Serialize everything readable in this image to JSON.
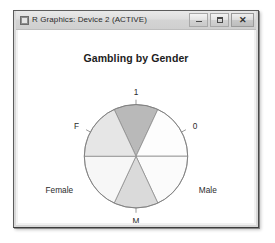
{
  "window": {
    "title": "R Graphics: Device 2 (ACTIVE)",
    "icon": "r-graphics-icon",
    "controls": {
      "minimize_label": "–",
      "maximize_label": "□",
      "close_label": "✕"
    }
  },
  "chart_data": {
    "type": "pie",
    "title": "Gambling by Gender",
    "xlabel": "",
    "ylabel": "",
    "legend_position": "none",
    "grid": false,
    "note": "Radial four-fold / pie style display of a 2x2 table: gender (Female, Male) crossed with gambling response (0, 1). Sector shading encodes cell magnitude; labels sit around the circle perimeter.",
    "categories": [
      "1",
      "0",
      "Male",
      "M",
      "Female",
      "F"
    ],
    "values": [
      55,
      90,
      90,
      55,
      90,
      90
    ],
    "slices": [
      {
        "label": "1",
        "label_position": "top",
        "start_angle": 65,
        "end_angle": 115,
        "value": 55,
        "color": "#b9b9b9",
        "description": "top sector, darkest shading, labeled 1"
      },
      {
        "label": "0",
        "label_position": "upper-right",
        "start_angle": 0,
        "end_angle": 65,
        "value": 90,
        "color": "#fdfdfd",
        "description": "upper-right sector, white fill, labeled 0"
      },
      {
        "label": "Male",
        "label_position": "right",
        "start_angle": 295,
        "end_angle": 360,
        "value": 90,
        "color": "#fbfbfb",
        "description": "lower-right sector, white fill, labeled Male"
      },
      {
        "label": "M",
        "label_position": "bottom",
        "start_angle": 245,
        "end_angle": 295,
        "value": 55,
        "color": "#dadada",
        "description": "bottom sector, light gray shading, labeled M"
      },
      {
        "label": "Female",
        "label_position": "left",
        "start_angle": 180,
        "end_angle": 245,
        "value": 90,
        "color": "#f7f7f7",
        "description": "lower-left sector, near-white fill, labeled Female"
      },
      {
        "label": "F",
        "label_position": "upper-left",
        "start_angle": 115,
        "end_angle": 180,
        "value": 90,
        "color": "#e6e6e6",
        "description": "upper-left sector, light gray fill, labeled F"
      }
    ],
    "axis_labels": [
      {
        "text": "1",
        "angle": 90,
        "kind": "tick"
      },
      {
        "text": "0",
        "angle": 28,
        "kind": "tick"
      },
      {
        "text": "Male",
        "angle": 332,
        "kind": "variable"
      },
      {
        "text": "M",
        "angle": 270,
        "kind": "tick"
      },
      {
        "text": "Female",
        "angle": 208,
        "kind": "variable"
      },
      {
        "text": "F",
        "angle": 152,
        "kind": "tick"
      }
    ],
    "geometry": {
      "center_x": 121,
      "center_y": 129,
      "radius": 53
    },
    "colors": {
      "outline": "#7d7d7d",
      "sector_stroke": "#8c8c8c",
      "background": "#ffffff",
      "text": "#2b2b2b"
    }
  }
}
